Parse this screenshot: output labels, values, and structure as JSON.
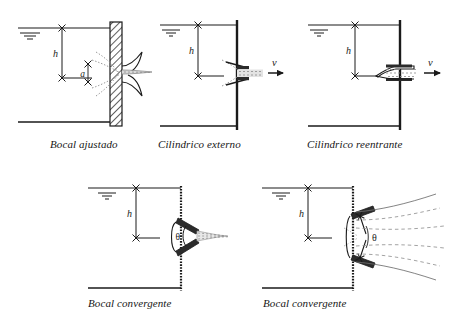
{
  "figure": {
    "background_color": "#ffffff",
    "ink_color": "#1a1a1a",
    "jet_color": "#8c8c8c"
  },
  "symbols": {
    "head_label": "h",
    "opening_label": "a",
    "velocity_label": "v",
    "angle_label": "θ",
    "free_surface_icon": "free-surface-triangle-icon"
  },
  "panels": [
    {
      "id": "bocal-ajustado",
      "caption": "Bocal ajustado",
      "wall_style": "hatched-thick",
      "nozzle_type": "flared-rounded",
      "labels": {
        "head": "h",
        "opening": "a"
      },
      "has_velocity_arrow": false,
      "has_angle": false
    },
    {
      "id": "cilindrico-externo",
      "caption": "Cilindrico externo",
      "wall_style": "thin-solid",
      "nozzle_type": "external-cylindrical",
      "labels": {
        "head": "h",
        "velocity": "v"
      },
      "has_velocity_arrow": true,
      "has_angle": false
    },
    {
      "id": "cilindrico-reentrante",
      "caption": "Cilindrico reentrante",
      "wall_style": "thin-solid",
      "nozzle_type": "reentrant-borda-tube",
      "labels": {
        "head": "h",
        "velocity": "v"
      },
      "has_velocity_arrow": true,
      "has_angle": false
    },
    {
      "id": "bocal-convergente-1",
      "caption": "Bocal convergente",
      "wall_style": "dotted-thin",
      "nozzle_type": "convergent-contracting-jet",
      "labels": {
        "head": "h",
        "angle": "θ"
      },
      "has_velocity_arrow": false,
      "has_angle": true
    },
    {
      "id": "bocal-convergente-2",
      "caption": "Bocal convergente",
      "wall_style": "dotted-thin",
      "nozzle_type": "convergent-spreading-jet",
      "labels": {
        "head": "h",
        "angle": "θ"
      },
      "has_velocity_arrow": false,
      "has_angle": true
    }
  ]
}
